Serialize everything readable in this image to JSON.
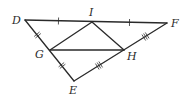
{
  "diagram": {
    "type": "geometry-triangle-midsegments",
    "stroke_color": "#2a2a2a",
    "points": {
      "D": {
        "label": "D",
        "x": 25,
        "y": 20,
        "lx": 12,
        "ly": 24
      },
      "F": {
        "label": "F",
        "x": 167,
        "y": 23,
        "lx": 171,
        "ly": 27
      },
      "E": {
        "label": "E",
        "x": 74,
        "y": 81,
        "lx": 69,
        "ly": 94
      },
      "I": {
        "label": "I",
        "x": 92,
        "y": 22,
        "lx": 89,
        "ly": 16
      },
      "G": {
        "label": "G",
        "x": 50,
        "y": 50,
        "lx": 35,
        "ly": 58
      },
      "H": {
        "label": "H",
        "x": 124,
        "y": 50,
        "lx": 127,
        "ly": 60
      }
    },
    "segments": [
      [
        "D",
        "F"
      ],
      [
        "D",
        "E"
      ],
      [
        "E",
        "F"
      ],
      [
        "G",
        "I"
      ],
      [
        "I",
        "H"
      ],
      [
        "G",
        "H"
      ]
    ],
    "tick_marks": [
      {
        "segment": [
          "D",
          "I"
        ],
        "count": 1
      },
      {
        "segment": [
          "I",
          "F"
        ],
        "count": 1
      },
      {
        "segment": [
          "D",
          "G"
        ],
        "count": 2
      },
      {
        "segment": [
          "G",
          "E"
        ],
        "count": 2
      },
      {
        "segment": [
          "E",
          "H"
        ],
        "count": 3
      },
      {
        "segment": [
          "H",
          "F"
        ],
        "count": 3
      }
    ]
  }
}
